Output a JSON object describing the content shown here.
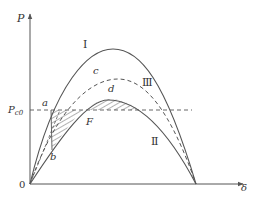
{
  "diagram": {
    "axes": {
      "y_label": "P",
      "x_label": "δ",
      "origin_label": "0",
      "reference_level_label": "P",
      "reference_level_subscript": "c0"
    },
    "curves": [
      {
        "id": "I",
        "label": "Ⅰ",
        "style": "solid",
        "description": "pre-fault curve"
      },
      {
        "id": "II",
        "label": "Ⅱ",
        "style": "solid",
        "description": "fault curve"
      },
      {
        "id": "III",
        "label": "Ⅲ",
        "style": "dashed",
        "description": "post-fault curve"
      }
    ],
    "points": {
      "a": "a",
      "b": "b",
      "c": "c",
      "d": "d",
      "F": "F"
    },
    "colors": {
      "line": "#555555",
      "text": "#333333",
      "background": "#ffffff"
    }
  }
}
